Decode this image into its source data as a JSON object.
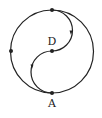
{
  "diagram": {
    "labels": {
      "center": "D",
      "bottom": "A"
    },
    "colors": {
      "stroke": "#222222",
      "background": "#ffffff"
    },
    "points": [
      {
        "name": "top",
        "x": 52,
        "y": 10
      },
      {
        "name": "left",
        "x": 11,
        "y": 51
      },
      {
        "name": "center",
        "label": "D",
        "x": 52,
        "y": 51
      },
      {
        "name": "bottom",
        "label": "A",
        "x": 52,
        "y": 93
      }
    ],
    "outer_circle": {
      "cx": 52,
      "cy": 51.5,
      "r": 41.5
    },
    "arrows": [
      {
        "x": 71,
        "y": 33,
        "direction": "down"
      },
      {
        "x": 32,
        "y": 67,
        "direction": "down"
      }
    ]
  }
}
